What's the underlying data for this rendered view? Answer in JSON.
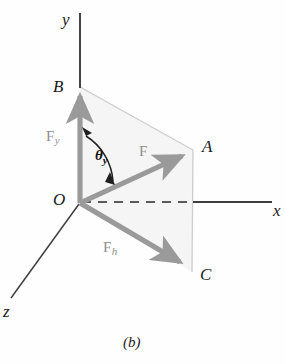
{
  "figure": {
    "caption": "(b)",
    "axes": [
      {
        "name": "y-axis",
        "label": "y"
      },
      {
        "name": "x-axis",
        "label": "x"
      },
      {
        "name": "z-axis",
        "label": "z"
      }
    ],
    "points": [
      {
        "name": "origin",
        "label": "O"
      },
      {
        "name": "point-b",
        "label": "B"
      },
      {
        "name": "point-a",
        "label": "A"
      },
      {
        "name": "point-c",
        "label": "C"
      }
    ],
    "vectors": [
      {
        "name": "force-y-component",
        "label": "F",
        "subscript": "y"
      },
      {
        "name": "force-resultant",
        "label": "F",
        "subscript": ""
      },
      {
        "name": "force-horizontal",
        "label": "F",
        "subscript": "h"
      }
    ],
    "angle": {
      "name": "theta-y",
      "label": "θ",
      "subscript": "y"
    },
    "colors": {
      "vector_gray": "#9a9a9a",
      "axis_dark": "#3a3a3a",
      "plane_fill": "#f4f4f4",
      "plane_edge": "#cfcfcf",
      "label_dark": "#1a1a1a",
      "label_gray": "#8e8e8e"
    }
  }
}
